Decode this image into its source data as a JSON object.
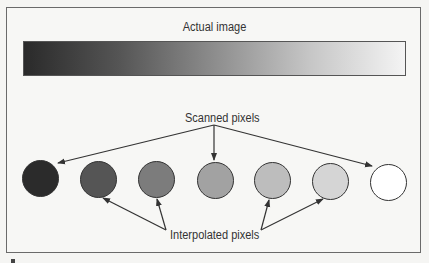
{
  "diagram": {
    "title": "Actual image",
    "gradient": {
      "from": "#2a2a2a",
      "to": "#f4f4f4"
    },
    "scanned_label": "Scanned pixels",
    "interpolated_label": "Interpolated pixels",
    "pixels": [
      {
        "type": "scanned",
        "color": "#2b2b2b",
        "cx": 40
      },
      {
        "type": "interpolated",
        "color": "#555555",
        "cx": 98
      },
      {
        "type": "interpolated",
        "color": "#7c7c7c",
        "cx": 156
      },
      {
        "type": "scanned",
        "color": "#a2a2a2",
        "cx": 215
      },
      {
        "type": "interpolated",
        "color": "#bdbdbd",
        "cx": 272
      },
      {
        "type": "interpolated",
        "color": "#d5d5d5",
        "cx": 330
      },
      {
        "type": "scanned",
        "color": "#ffffff",
        "cx": 388
      }
    ],
    "colors": {
      "frame": "#6a6a6a",
      "arrow": "#333333",
      "text": "#333333"
    }
  }
}
